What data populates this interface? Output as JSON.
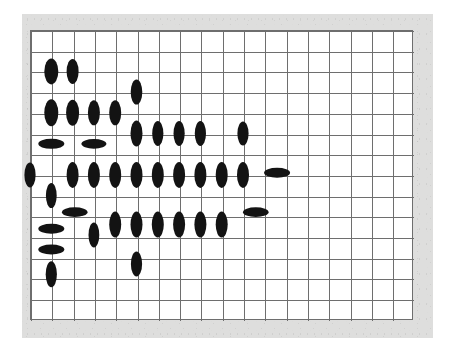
{
  "figure": {
    "title": "",
    "kind": "ellipse-glyph-grid",
    "background_color": "#ffffff",
    "mat_color": "#dededd",
    "grid_line_color": "#6e6e6e",
    "glyph_color": "#131313"
  },
  "chart_data": {
    "type": "scatter",
    "title": "",
    "subtitle": "",
    "xlabel": "",
    "ylabel": "",
    "legend": [],
    "annotations": [],
    "grid": true,
    "grid_columns": 18,
    "grid_rows": 14,
    "cell_width": 21.3,
    "cell_height": 20.7,
    "origin_x": 30,
    "origin_y": 30,
    "xlim": [
      0,
      18
    ],
    "ylim": [
      0,
      14
    ],
    "xtick_labels": [],
    "ytick_labels": [],
    "glyph_shape": "ellipse",
    "glyph_encoding": "orientation and aspect of each ellipse encodes the local value; tall ellipses are vertical, flat ellipses are horizontal",
    "points": [
      {
        "col": 1,
        "row": 2,
        "rx": 7.0,
        "ry": 13.0,
        "angle": 0
      },
      {
        "col": 2,
        "row": 2,
        "rx": 6.0,
        "ry": 12.5,
        "angle": 0
      },
      {
        "col": 5,
        "row": 3,
        "rx": 5.8,
        "ry": 12.5,
        "angle": 0
      },
      {
        "col": 1,
        "row": 4,
        "rx": 7.0,
        "ry": 13.5,
        "angle": 0
      },
      {
        "col": 2,
        "row": 4,
        "rx": 6.5,
        "ry": 13.0,
        "angle": 0
      },
      {
        "col": 3,
        "row": 4,
        "rx": 6.0,
        "ry": 12.5,
        "angle": 0
      },
      {
        "col": 4,
        "row": 4,
        "rx": 6.0,
        "ry": 12.5,
        "angle": 0
      },
      {
        "col": 5,
        "row": 5,
        "rx": 6.0,
        "ry": 13.0,
        "angle": 0
      },
      {
        "col": 6,
        "row": 5,
        "rx": 5.6,
        "ry": 12.5,
        "angle": 0
      },
      {
        "col": 7,
        "row": 5,
        "rx": 5.6,
        "ry": 12.5,
        "angle": 0
      },
      {
        "col": 8,
        "row": 5,
        "rx": 5.6,
        "ry": 12.5,
        "angle": 0
      },
      {
        "col": 10,
        "row": 5,
        "rx": 5.6,
        "ry": 12.0,
        "angle": 0
      },
      {
        "col": 1,
        "row": 5.5,
        "rx": 13.0,
        "ry": 5.0,
        "angle": 0
      },
      {
        "col": 3,
        "row": 5.5,
        "rx": 12.5,
        "ry": 4.8,
        "angle": 0
      },
      {
        "col": 0,
        "row": 7,
        "rx": 5.6,
        "ry": 12.5,
        "angle": 0
      },
      {
        "col": 2,
        "row": 7,
        "rx": 6.0,
        "ry": 13.0,
        "angle": 0
      },
      {
        "col": 3,
        "row": 7,
        "rx": 6.0,
        "ry": 13.0,
        "angle": 0
      },
      {
        "col": 4,
        "row": 7,
        "rx": 6.0,
        "ry": 13.0,
        "angle": 0
      },
      {
        "col": 5,
        "row": 7,
        "rx": 6.0,
        "ry": 13.0,
        "angle": 0
      },
      {
        "col": 6,
        "row": 7,
        "rx": 6.0,
        "ry": 13.0,
        "angle": 0
      },
      {
        "col": 7,
        "row": 7,
        "rx": 6.0,
        "ry": 13.0,
        "angle": 0
      },
      {
        "col": 8,
        "row": 7,
        "rx": 6.0,
        "ry": 13.0,
        "angle": 0
      },
      {
        "col": 9,
        "row": 7,
        "rx": 6.0,
        "ry": 13.0,
        "angle": 0
      },
      {
        "col": 10,
        "row": 7,
        "rx": 6.0,
        "ry": 13.0,
        "angle": 0
      },
      {
        "col": 11.6,
        "row": 6.9,
        "rx": 13.0,
        "ry": 5.0,
        "angle": 0
      },
      {
        "col": 1,
        "row": 8,
        "rx": 5.4,
        "ry": 12.5,
        "angle": 0
      },
      {
        "col": 2.1,
        "row": 8.8,
        "rx": 12.8,
        "ry": 4.8,
        "angle": 0
      },
      {
        "col": 10.6,
        "row": 8.8,
        "rx": 12.8,
        "ry": 4.8,
        "angle": 0
      },
      {
        "col": 4,
        "row": 9.4,
        "rx": 6.0,
        "ry": 13.0,
        "angle": 0
      },
      {
        "col": 5,
        "row": 9.4,
        "rx": 6.0,
        "ry": 13.0,
        "angle": 0
      },
      {
        "col": 6,
        "row": 9.4,
        "rx": 6.0,
        "ry": 13.0,
        "angle": 0
      },
      {
        "col": 7,
        "row": 9.4,
        "rx": 6.0,
        "ry": 13.0,
        "angle": 0
      },
      {
        "col": 8,
        "row": 9.4,
        "rx": 6.0,
        "ry": 13.0,
        "angle": 0
      },
      {
        "col": 9,
        "row": 9.4,
        "rx": 6.0,
        "ry": 13.0,
        "angle": 0
      },
      {
        "col": 1,
        "row": 9.6,
        "rx": 13.0,
        "ry": 5.0,
        "angle": 0
      },
      {
        "col": 3,
        "row": 9.9,
        "rx": 5.4,
        "ry": 12.5,
        "angle": 0
      },
      {
        "col": 1,
        "row": 10.6,
        "rx": 13.0,
        "ry": 5.0,
        "angle": 0
      },
      {
        "col": 5,
        "row": 11.3,
        "rx": 5.6,
        "ry": 12.5,
        "angle": 0
      },
      {
        "col": 1,
        "row": 11.8,
        "rx": 5.6,
        "ry": 13.0,
        "angle": 0
      }
    ]
  }
}
